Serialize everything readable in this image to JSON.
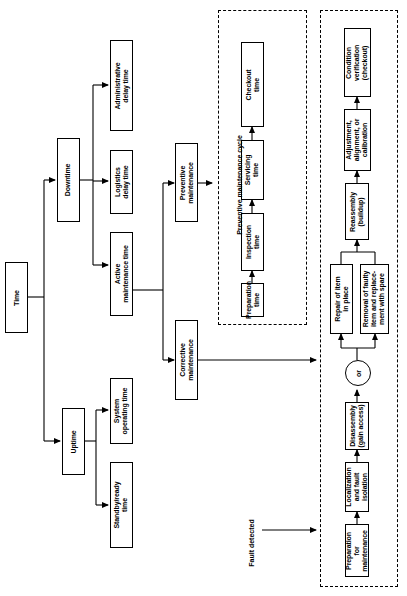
{
  "diagram": {
    "colors": {
      "line": "#000000",
      "box_fill": "#ffffff",
      "background": "#ffffff"
    },
    "nodes": [
      {
        "id": "time",
        "label": "Time"
      },
      {
        "id": "downtime",
        "label": "Downtime"
      },
      {
        "id": "uptime",
        "label": "Uptime"
      },
      {
        "id": "admin_delay",
        "label": "Administrative\ndelay time"
      },
      {
        "id": "logistics_delay",
        "label": "Logistics\ndelay time"
      },
      {
        "id": "active_maint",
        "label": "Active\nmaintenance time"
      },
      {
        "id": "system_op",
        "label": "System\noperating time"
      },
      {
        "id": "standby",
        "label": "Standby/ready\ntime"
      },
      {
        "id": "preventive",
        "label": "Preventive\nmaintenance"
      },
      {
        "id": "corrective",
        "label": "Corrective\nmaintenance"
      },
      {
        "id": "preparation_pm",
        "label": "Preparation\ntime"
      },
      {
        "id": "inspection",
        "label": "Inspection\ntime"
      },
      {
        "id": "servicing",
        "label": "Servicing\ntime"
      },
      {
        "id": "checkout",
        "label": "Checkout\ntime"
      },
      {
        "id": "prep_maint",
        "label": "Preparation\nfor\nmaintenance"
      },
      {
        "id": "localization",
        "label": "Localization\nand fault\nisolation"
      },
      {
        "id": "disassembly",
        "label": "Disassembly\n(gain access)"
      },
      {
        "id": "repair_place",
        "label": "Repair of item\nin place"
      },
      {
        "id": "removal",
        "label": "Removal of faulty\nitem and replace-\nment with spare"
      },
      {
        "id": "reassembly",
        "label": "Reassembly\n(buildup)"
      },
      {
        "id": "adjustment",
        "label": "Adjustment,\nalignment, or\ncalibration"
      },
      {
        "id": "condition_ver",
        "label": "Condition\nverification\n(checkout)"
      }
    ],
    "or_gate": {
      "id": "or_node",
      "label": "or"
    },
    "group_labels": [
      {
        "id": "pm_cycle_label",
        "label": "Preventive maintenance cycle"
      }
    ],
    "annotations": [
      {
        "id": "fault_detected",
        "label": "Fault detected"
      }
    ]
  }
}
